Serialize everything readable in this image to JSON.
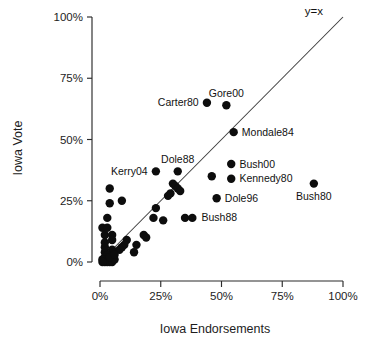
{
  "chart_data": {
    "type": "scatter",
    "title": "",
    "xlabel": "Iowa Endorsements",
    "ylabel": "Iowa Vote",
    "xlim": [
      0,
      100
    ],
    "ylim": [
      0,
      100
    ],
    "xticks": [
      "0%",
      "25%",
      "50%",
      "75%",
      "100%"
    ],
    "xtick_values": [
      0,
      25,
      50,
      75,
      100
    ],
    "yticks": [
      "0%",
      "25%",
      "50%",
      "75%",
      "100%"
    ],
    "ytick_values": [
      0,
      25,
      50,
      75,
      100
    ],
    "grid": false,
    "legend": "none",
    "units": "percent",
    "annotations": [
      {
        "name": "identity-line-label",
        "text": "y=x",
        "x": 88,
        "y": 101
      }
    ],
    "reference_lines": [
      {
        "name": "identity-line",
        "label": "y=x",
        "equation": "y = x",
        "from": [
          0,
          0
        ],
        "to": [
          100,
          100
        ]
      }
    ],
    "labeled_points": [
      {
        "label": "Carter80",
        "x": 44,
        "y": 65,
        "label_side": "left"
      },
      {
        "label": "Gore00",
        "x": 52,
        "y": 64,
        "label_side": "above"
      },
      {
        "label": "Mondale84",
        "x": 55,
        "y": 53,
        "label_side": "right"
      },
      {
        "label": "Bush00",
        "x": 54,
        "y": 40,
        "label_side": "right"
      },
      {
        "label": "Kennedy80",
        "x": 54,
        "y": 34,
        "label_side": "right"
      },
      {
        "label": "Dole96",
        "x": 48,
        "y": 26,
        "label_side": "right"
      },
      {
        "label": "Bush80",
        "x": 88,
        "y": 32,
        "label_side": "below"
      },
      {
        "label": "Dole88",
        "x": 32,
        "y": 37,
        "label_side": "above"
      },
      {
        "label": "Kerry04",
        "x": 23,
        "y": 37,
        "label_side": "left"
      },
      {
        "label": "Bush88",
        "x": 35,
        "y": 18,
        "label_side": "right"
      },
      {
        "label": "Bush88",
        "x": 38,
        "y": 18,
        "label_side": "right"
      }
    ],
    "unlabeled_points": [
      {
        "x": 46,
        "y": 35
      },
      {
        "x": 30,
        "y": 32
      },
      {
        "x": 31,
        "y": 31
      },
      {
        "x": 32,
        "y": 30
      },
      {
        "x": 33,
        "y": 29
      },
      {
        "x": 29,
        "y": 28
      },
      {
        "x": 28,
        "y": 27
      },
      {
        "x": 4,
        "y": 30
      },
      {
        "x": 9,
        "y": 25
      },
      {
        "x": 4,
        "y": 24
      },
      {
        "x": 23,
        "y": 22
      },
      {
        "x": 3,
        "y": 18
      },
      {
        "x": 22,
        "y": 18
      },
      {
        "x": 1,
        "y": 14
      },
      {
        "x": 3,
        "y": 14
      },
      {
        "x": 2,
        "y": 11
      },
      {
        "x": 5,
        "y": 11
      },
      {
        "x": 18,
        "y": 11
      },
      {
        "x": 19,
        "y": 10
      },
      {
        "x": 5,
        "y": 9
      },
      {
        "x": 11,
        "y": 9
      },
      {
        "x": 10,
        "y": 7
      },
      {
        "x": 15,
        "y": 7
      },
      {
        "x": 9,
        "y": 6
      },
      {
        "x": 5,
        "y": 5
      },
      {
        "x": 8,
        "y": 5
      },
      {
        "x": 14,
        "y": 4
      },
      {
        "x": 2,
        "y": 4
      },
      {
        "x": 3,
        "y": 3
      },
      {
        "x": 2,
        "y": 2
      },
      {
        "x": 3,
        "y": 1
      },
      {
        "x": 2,
        "y": 1
      },
      {
        "x": 1,
        "y": 1
      },
      {
        "x": 2,
        "y": 0
      },
      {
        "x": 3,
        "y": 0
      },
      {
        "x": 4,
        "y": 0
      },
      {
        "x": 1,
        "y": 0
      },
      {
        "x": 5,
        "y": 0
      },
      {
        "x": 6,
        "y": 1
      },
      {
        "x": 4,
        "y": 2
      },
      {
        "x": 2,
        "y": 6
      },
      {
        "x": 2,
        "y": 8
      },
      {
        "x": 6,
        "y": 3
      },
      {
        "x": 26,
        "y": 17
      }
    ]
  },
  "colors": {
    "point": "#0d0d0d",
    "axis": "#2b2b2b",
    "reference_line": "#3a3a3a",
    "background": "#ffffff",
    "text": "#1a1a1a"
  }
}
